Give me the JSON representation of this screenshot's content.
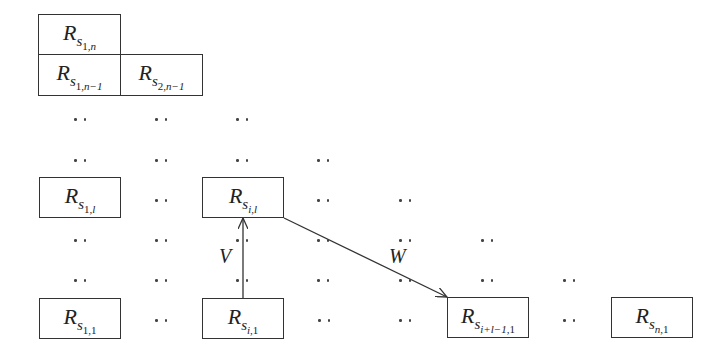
{
  "diagram": {
    "boxes": [
      {
        "id": "r-s1n",
        "base": "R",
        "s": "s",
        "sub_main": "1",
        "sub_second": "n",
        "text": "R_{s_{1,n}}",
        "x": 38,
        "y": 14,
        "w": 83,
        "h": 41
      },
      {
        "id": "r-s1n-1",
        "base": "R",
        "s": "s",
        "sub_main": "1",
        "sub_second": "n−1",
        "text": "R_{s_{1,n-1}}",
        "x": 38,
        "y": 54,
        "w": 83,
        "h": 42
      },
      {
        "id": "r-s2n-1",
        "base": "R",
        "s": "s",
        "sub_main": "2",
        "sub_second": "n−1",
        "text": "R_{s_{2,n-1}}",
        "x": 120,
        "y": 54,
        "w": 83,
        "h": 42
      },
      {
        "id": "r-s1l",
        "base": "R",
        "s": "s",
        "sub_main": "1",
        "sub_second": "l",
        "text": "R_{s_{1,l}}",
        "x": 39,
        "y": 177,
        "w": 82,
        "h": 41
      },
      {
        "id": "r-sil",
        "base": "R",
        "s": "s",
        "sub_main": "i",
        "sub_second": "l",
        "text": "R_{s_{i,l}}",
        "x": 202,
        "y": 177,
        "w": 82,
        "h": 41
      },
      {
        "id": "r-s11",
        "base": "R",
        "s": "s",
        "sub_main": "1",
        "sub_second": "1",
        "text": "R_{s_{1,1}}",
        "x": 39,
        "y": 298,
        "w": 82,
        "h": 41
      },
      {
        "id": "r-si1",
        "base": "R",
        "s": "s",
        "sub_main": "i",
        "sub_second": "1",
        "text": "R_{s_{i,1}}",
        "x": 202,
        "y": 298,
        "w": 82,
        "h": 41
      },
      {
        "id": "r-si+l-1-1",
        "base": "R",
        "s": "s",
        "sub_main": "i+l−1",
        "sub_second": "1",
        "text": "R_{s_{i+l-1,1}}",
        "x": 447,
        "y": 297,
        "w": 82,
        "h": 41
      },
      {
        "id": "r-sn1",
        "base": "R",
        "s": "s",
        "sub_main": "n",
        "sub_second": "1",
        "text": "R_{s_{n,1}}",
        "x": 611,
        "y": 297,
        "w": 82,
        "h": 41
      }
    ],
    "ellipsis_glyph": "··",
    "ellipses": [
      {
        "x": 80,
        "y": 120
      },
      {
        "x": 161,
        "y": 120
      },
      {
        "x": 242,
        "y": 120
      },
      {
        "x": 80,
        "y": 161
      },
      {
        "x": 161,
        "y": 161
      },
      {
        "x": 242,
        "y": 161
      },
      {
        "x": 323,
        "y": 161
      },
      {
        "x": 161,
        "y": 201
      },
      {
        "x": 323,
        "y": 201
      },
      {
        "x": 405,
        "y": 201
      },
      {
        "x": 80,
        "y": 241
      },
      {
        "x": 161,
        "y": 241
      },
      {
        "x": 242,
        "y": 241
      },
      {
        "x": 323,
        "y": 241
      },
      {
        "x": 405,
        "y": 241
      },
      {
        "x": 487,
        "y": 241
      },
      {
        "x": 80,
        "y": 281
      },
      {
        "x": 161,
        "y": 281
      },
      {
        "x": 242,
        "y": 281
      },
      {
        "x": 323,
        "y": 281
      },
      {
        "x": 405,
        "y": 281
      },
      {
        "x": 487,
        "y": 281
      },
      {
        "x": 569,
        "y": 281
      },
      {
        "x": 161,
        "y": 321
      },
      {
        "x": 324,
        "y": 321
      },
      {
        "x": 405,
        "y": 321
      },
      {
        "x": 569,
        "y": 321
      }
    ],
    "edges": [
      {
        "id": "edge-v",
        "label": "V",
        "from": "r-si1",
        "to": "r-sil",
        "x1": 243,
        "y1": 298,
        "x2": 243,
        "y2": 218,
        "label_x": 219,
        "label_y": 246
      },
      {
        "id": "edge-w",
        "label": "W",
        "from": "r-sil",
        "to": "r-si+l-1-1",
        "x1": 284,
        "y1": 218,
        "x2": 447,
        "y2": 297,
        "label_x": 389,
        "label_y": 246
      }
    ],
    "colors": {
      "stroke": "#333333",
      "text": "#222222",
      "background": "#ffffff"
    }
  }
}
